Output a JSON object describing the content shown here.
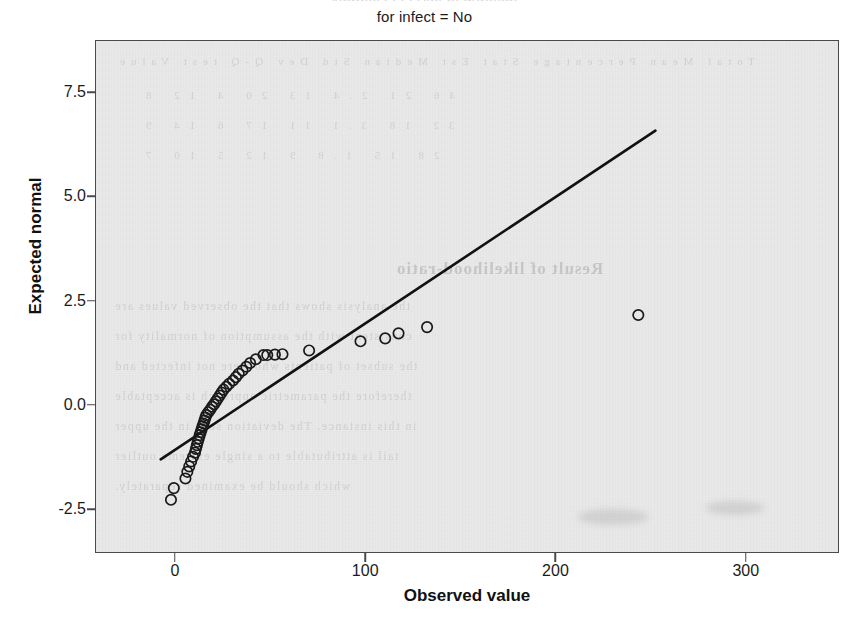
{
  "figure": {
    "subtitle": "for infect = No",
    "ghost_title_fragment": "Normal Q-Q Plot of duration"
  },
  "bleed_text": {
    "line1": "Total   Mean   Percentage   Stat Est   Median   Std Dev   Q-Q test   Value",
    "line2": "46      21       2.4        13       20        4          12       8",
    "line3": "32      18       3.1        11       17        6          14       9",
    "line4": "28      15       1.8         9       12        5          10       7",
    "heading": "Result of likelihood-ratio",
    "body1": "the analysis shows that the observed values are",
    "body2": "consistent with the assumption of normality for",
    "body3": "the subset of patients who were not infected and",
    "body4": "therefore the parametric approach is acceptable",
    "body5": "in this instance. The deviation seen in the upper",
    "body6": "tail is attributable to a single extreme outlier",
    "body7": "which should be examined separately."
  },
  "chart_data": {
    "type": "scatter",
    "title": "",
    "subtitle": "for infect = No",
    "xlabel": "Observed value",
    "ylabel": "Expected normal",
    "xlim": [
      -42,
      349
    ],
    "ylim": [
      -3.55,
      8.75
    ],
    "xticks": [
      0,
      100,
      200,
      300
    ],
    "xtick_labels": [
      "0",
      "100",
      "200",
      "300"
    ],
    "yticks": [
      -2.5,
      0.0,
      2.5,
      5.0,
      7.5
    ],
    "ytick_labels": [
      "-2.5",
      "0.0",
      "2.5",
      "5.0",
      "7.5"
    ],
    "grid": false,
    "legend": false,
    "marker": "open-circle",
    "marker_color": "#1a1a1a",
    "line_color": "#111111",
    "panel_color": "#e9e9e9",
    "reference_line": {
      "label": "normal reference line",
      "x_start": -8.0,
      "y_start": -1.28,
      "x_end": 252.0,
      "y_end": 6.6
    },
    "points": [
      {
        "x": -2.6,
        "y": -2.25
      },
      {
        "x": -1.1,
        "y": -1.97
      },
      {
        "x": 5.0,
        "y": -1.74
      },
      {
        "x": 6.0,
        "y": -1.58
      },
      {
        "x": 7.0,
        "y": -1.45
      },
      {
        "x": 8.0,
        "y": -1.33
      },
      {
        "x": 9.0,
        "y": -1.22
      },
      {
        "x": 10.0,
        "y": -1.12
      },
      {
        "x": 10.5,
        "y": -1.03
      },
      {
        "x": 11.0,
        "y": -0.94
      },
      {
        "x": 11.5,
        "y": -0.86
      },
      {
        "x": 12.0,
        "y": -0.78
      },
      {
        "x": 12.5,
        "y": -0.7
      },
      {
        "x": 13.0,
        "y": -0.63
      },
      {
        "x": 13.5,
        "y": -0.56
      },
      {
        "x": 14.0,
        "y": -0.49
      },
      {
        "x": 14.5,
        "y": -0.42
      },
      {
        "x": 15.0,
        "y": -0.35
      },
      {
        "x": 15.5,
        "y": -0.28
      },
      {
        "x": 16.0,
        "y": -0.22
      },
      {
        "x": 17.0,
        "y": -0.15
      },
      {
        "x": 18.0,
        "y": -0.09
      },
      {
        "x": 19.0,
        "y": -0.02
      },
      {
        "x": 20.0,
        "y": 0.04
      },
      {
        "x": 21.0,
        "y": 0.11
      },
      {
        "x": 22.0,
        "y": 0.18
      },
      {
        "x": 23.0,
        "y": 0.25
      },
      {
        "x": 24.0,
        "y": 0.32
      },
      {
        "x": 25.0,
        "y": 0.39
      },
      {
        "x": 26.5,
        "y": 0.46
      },
      {
        "x": 28.0,
        "y": 0.53
      },
      {
        "x": 30.0,
        "y": 0.61
      },
      {
        "x": 31.5,
        "y": 0.69
      },
      {
        "x": 33.0,
        "y": 0.77
      },
      {
        "x": 35.0,
        "y": 0.85
      },
      {
        "x": 37.0,
        "y": 0.94
      },
      {
        "x": 39.0,
        "y": 1.03
      },
      {
        "x": 42.0,
        "y": 1.12
      },
      {
        "x": 46.0,
        "y": 1.22
      },
      {
        "x": 48.0,
        "y": 1.22
      },
      {
        "x": 52.0,
        "y": 1.23
      },
      {
        "x": 56.0,
        "y": 1.24
      },
      {
        "x": 70.0,
        "y": 1.33
      },
      {
        "x": 97.0,
        "y": 1.55
      },
      {
        "x": 110.0,
        "y": 1.62
      },
      {
        "x": 117.0,
        "y": 1.74
      },
      {
        "x": 132.0,
        "y": 1.89
      },
      {
        "x": 243.0,
        "y": 2.18
      }
    ]
  }
}
